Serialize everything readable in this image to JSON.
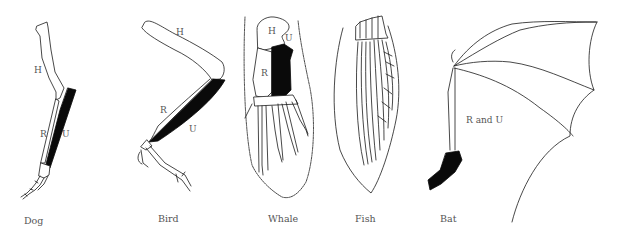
{
  "figure": {
    "colors": {
      "ink": "#1a1a1a",
      "fill_ulna": "#0a0a0a",
      "label": "#555555",
      "background": "#ffffff"
    },
    "panels": [
      {
        "id": "dog",
        "caption": "Dog",
        "labels": {
          "humerus": "H",
          "radius": "R",
          "ulna": "U"
        }
      },
      {
        "id": "bird",
        "caption": "Bird",
        "labels": {
          "humerus": "H",
          "radius": "R",
          "ulna": "U"
        }
      },
      {
        "id": "whale",
        "caption": "Whale",
        "labels": {
          "humerus": "H",
          "radius": "R",
          "ulna": "U"
        }
      },
      {
        "id": "fish",
        "caption": "Fish",
        "labels": {}
      },
      {
        "id": "bat",
        "caption": "Bat",
        "labels": {
          "radius_ulna": "R and U"
        }
      }
    ]
  }
}
